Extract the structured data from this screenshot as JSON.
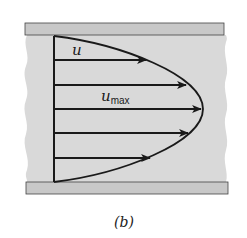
{
  "figure": {
    "caption": "(b)",
    "labels": {
      "u": "u",
      "u_max_main": "u",
      "u_max_sub": "max"
    },
    "colors": {
      "fluid": "#d9d9d9",
      "wall": "#c8c8c8",
      "line": "#1a1a1a",
      "background": "#ffffff"
    },
    "velocity_profile": {
      "shape": "parabolic",
      "arrows": [
        {
          "y": 60,
          "tip_x": 146
        },
        {
          "y": 85,
          "tip_x": 186
        },
        {
          "y": 109,
          "tip_x": 201
        },
        {
          "y": 133,
          "tip_x": 188
        },
        {
          "y": 158,
          "tip_x": 150
        }
      ]
    }
  }
}
